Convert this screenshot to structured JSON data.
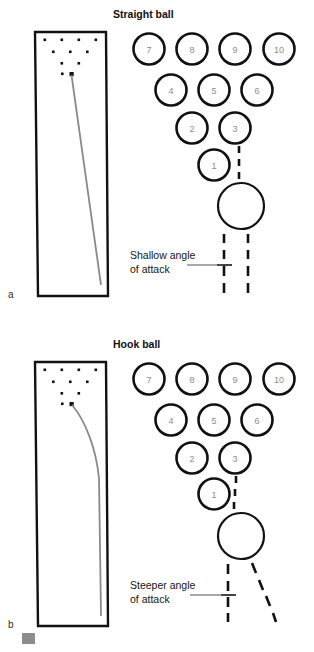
{
  "figure": {
    "width": 314,
    "height": 652,
    "background": "#ffffff"
  },
  "colors": {
    "line": "#111111",
    "pin_label": "#8d8d8d",
    "ball_path": "#8a8a8a",
    "annotation": "#151515",
    "swatch": "#8c8c8c"
  },
  "panels": [
    {
      "letter": "a",
      "title": "Straight ball",
      "annotation_line1": "Shallow angle",
      "annotation_line2": "of attack",
      "pins": [
        {
          "num": "7",
          "cx": 149,
          "cy": 49
        },
        {
          "num": "8",
          "cx": 192,
          "cy": 49
        },
        {
          "num": "9",
          "cx": 235,
          "cy": 49
        },
        {
          "num": "10",
          "cx": 279,
          "cy": 49
        },
        {
          "num": "4",
          "cx": 171,
          "cy": 90
        },
        {
          "num": "5",
          "cx": 214,
          "cy": 90
        },
        {
          "num": "6",
          "cx": 257,
          "cy": 90
        },
        {
          "num": "2",
          "cx": 192,
          "cy": 128
        },
        {
          "num": "3",
          "cx": 235,
          "cy": 128
        }
      ],
      "head_pin": {
        "num": "1",
        "cx": 214,
        "cy": 165
      },
      "ball": {
        "cx": 241,
        "cy": 206,
        "r": 23
      },
      "lane_dots": [
        [
          45,
          40
        ],
        [
          62,
          40
        ],
        [
          79,
          40
        ],
        [
          96,
          40
        ],
        [
          53,
          52
        ],
        [
          70,
          52
        ],
        [
          87,
          52
        ],
        [
          62,
          63
        ],
        [
          79,
          63
        ],
        [
          70,
          74
        ]
      ],
      "approach": "straight"
    },
    {
      "letter": "b",
      "title": "Hook ball",
      "annotation_line1": "Steeper angle",
      "annotation_line2": "of attack",
      "pins": [
        {
          "num": "7",
          "cx": 149,
          "cy": 379
        },
        {
          "num": "8",
          "cx": 192,
          "cy": 379
        },
        {
          "num": "9",
          "cx": 235,
          "cy": 379
        },
        {
          "num": "10",
          "cx": 279,
          "cy": 379
        },
        {
          "num": "4",
          "cx": 171,
          "cy": 420
        },
        {
          "num": "5",
          "cx": 214,
          "cy": 420
        },
        {
          "num": "6",
          "cx": 257,
          "cy": 420
        },
        {
          "num": "2",
          "cx": 192,
          "cy": 458
        },
        {
          "num": "3",
          "cx": 235,
          "cy": 458
        }
      ],
      "head_pin": {
        "num": "1",
        "cx": 214,
        "cy": 494
      },
      "ball": {
        "cx": 241,
        "cy": 536,
        "r": 23
      },
      "lane_dots": [
        [
          45,
          370
        ],
        [
          62,
          370
        ],
        [
          79,
          370
        ],
        [
          96,
          370
        ],
        [
          53,
          382
        ],
        [
          70,
          382
        ],
        [
          87,
          382
        ],
        [
          62,
          393
        ],
        [
          79,
          393
        ],
        [
          70,
          404
        ]
      ],
      "approach": "hook"
    }
  ],
  "legend_swatch": {
    "x": 22,
    "y": 633,
    "w": 13,
    "h": 11
  }
}
